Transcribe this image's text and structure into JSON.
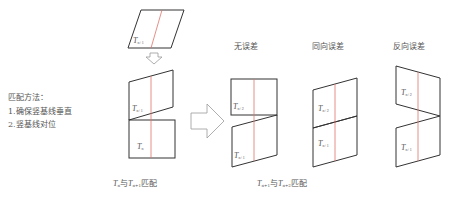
{
  "method": {
    "title": "匹配方法：",
    "steps": [
      "1.确保竖基线垂直",
      "2.竖基线对位"
    ]
  },
  "columns": {
    "no_error": "无误差",
    "same_direction_error": "同向误差",
    "reverse_direction_error": "反向误差"
  },
  "tiles": {
    "t_main": "T",
    "sub_n": "n",
    "sub_n1": "n+1",
    "sub_n2": "n+2"
  },
  "captions": {
    "left": {
      "a": "T",
      "a_sub": "n",
      "mid": "与",
      "b": "T",
      "b_sub": "n+1",
      "tail": "匹配"
    },
    "right": {
      "a": "T",
      "a_sub": "n+1",
      "mid": "与",
      "b": "T",
      "b_sub": "n+2",
      "tail": "匹配"
    }
  },
  "colors": {
    "outline": "#333333",
    "baseline": "#e0736a",
    "arrow": "#999999",
    "text": "#555555"
  }
}
